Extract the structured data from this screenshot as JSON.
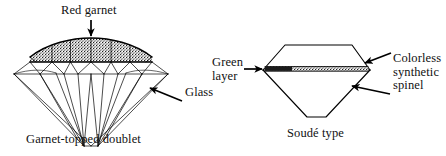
{
  "figure": {
    "background_color": "#ffffff",
    "ink_color": "#000000",
    "diagrams": [
      {
        "id": "garnet-topped-doublet",
        "caption": "Garnet-topped doublet",
        "shape": "round brilliant cut, side view",
        "labels": [
          {
            "id": "red-garnet",
            "text": "Red garnet",
            "arrow": "down",
            "points_to": "crown / table layer"
          },
          {
            "id": "glass",
            "text": "Glass",
            "arrow": "up-left",
            "points_to": "pavilion"
          }
        ],
        "layers": [
          {
            "name": "Red garnet",
            "region": "crown",
            "fill": "stippled dark"
          },
          {
            "name": "Glass",
            "region": "pavilion",
            "fill": "outline only"
          }
        ]
      },
      {
        "id": "soude-type",
        "caption": "Soudé type",
        "shape": "hexagonal crown with triangular pavilion, side view",
        "labels": [
          {
            "id": "green-layer",
            "text": "Green\nlayer",
            "line1": "Green",
            "line2": "layer",
            "arrow": "right",
            "points_to": "girdle seam"
          },
          {
            "id": "colorless-synthetic-spinel",
            "text": "Colorless\nsynthetic\nspinel",
            "line1": "Colorless",
            "line2": "synthetic",
            "line3": "spinel",
            "arrow": "left",
            "points_to": "crown and pavilion"
          }
        ],
        "layers": [
          {
            "name": "Green layer",
            "region": "girdle",
            "fill": "thin stippled band"
          },
          {
            "name": "Colorless synthetic spinel",
            "region": "crown and pavilion",
            "fill": "outline only"
          }
        ]
      }
    ]
  }
}
